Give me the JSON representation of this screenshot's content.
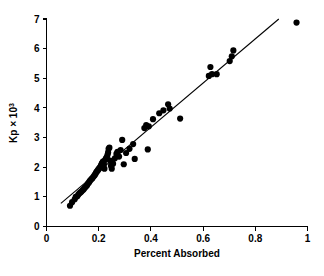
{
  "chart_data": {
    "type": "scatter",
    "title": "",
    "xlabel": "Percent Absorbed",
    "ylabel": "Kp × 10",
    "ylabel_exponent": "3",
    "xlim": [
      0,
      1
    ],
    "ylim": [
      0,
      7
    ],
    "xticks": [
      0,
      0.2,
      0.4,
      0.6,
      0.8,
      1
    ],
    "xtick_labels": [
      "0",
      "0.2",
      "0.4",
      "0.6",
      "0.8",
      "1"
    ],
    "yticks": [
      0,
      1,
      2,
      3,
      4,
      5,
      6,
      7
    ],
    "ytick_labels": [
      "0",
      "1",
      "2",
      "3",
      "4",
      "5",
      "6",
      "7"
    ],
    "grid": false,
    "legend": false,
    "point_color": "#000000",
    "line_color": "#000000",
    "background_color": "#ffffff",
    "marker": "filled-circle",
    "marker_size_px": 3.1,
    "fit_line": {
      "x_start": 0.055,
      "y_start": 0.78,
      "x_end": 0.89,
      "y_end": 7.0,
      "slope": 7.44,
      "intercept": 0.37
    },
    "points": [
      [
        0.09,
        0.7
      ],
      [
        0.098,
        0.82
      ],
      [
        0.108,
        0.92
      ],
      [
        0.112,
        1.0
      ],
      [
        0.118,
        1.02
      ],
      [
        0.122,
        1.08
      ],
      [
        0.126,
        1.12
      ],
      [
        0.13,
        1.15
      ],
      [
        0.134,
        1.18
      ],
      [
        0.138,
        1.22
      ],
      [
        0.142,
        1.25
      ],
      [
        0.146,
        1.3
      ],
      [
        0.15,
        1.34
      ],
      [
        0.155,
        1.38
      ],
      [
        0.158,
        1.44
      ],
      [
        0.162,
        1.48
      ],
      [
        0.165,
        1.52
      ],
      [
        0.168,
        1.56
      ],
      [
        0.172,
        1.6
      ],
      [
        0.175,
        1.62
      ],
      [
        0.178,
        1.66
      ],
      [
        0.182,
        1.7
      ],
      [
        0.185,
        1.74
      ],
      [
        0.188,
        1.78
      ],
      [
        0.19,
        1.82
      ],
      [
        0.193,
        1.86
      ],
      [
        0.196,
        1.88
      ],
      [
        0.198,
        1.92
      ],
      [
        0.201,
        1.95
      ],
      [
        0.204,
        1.98
      ],
      [
        0.206,
        2.0
      ],
      [
        0.208,
        2.04
      ],
      [
        0.21,
        2.08
      ],
      [
        0.212,
        2.12
      ],
      [
        0.214,
        2.15
      ],
      [
        0.216,
        2.18
      ],
      [
        0.218,
        2.2
      ],
      [
        0.22,
        2.1
      ],
      [
        0.222,
        1.95
      ],
      [
        0.225,
        2.25
      ],
      [
        0.228,
        2.3
      ],
      [
        0.231,
        2.34
      ],
      [
        0.234,
        2.42
      ],
      [
        0.236,
        2.5
      ],
      [
        0.238,
        2.62
      ],
      [
        0.241,
        2.66
      ],
      [
        0.244,
        2.22
      ],
      [
        0.247,
        2.05
      ],
      [
        0.25,
        1.95
      ],
      [
        0.255,
        2.12
      ],
      [
        0.262,
        2.3
      ],
      [
        0.268,
        2.45
      ],
      [
        0.272,
        2.52
      ],
      [
        0.278,
        2.36
      ],
      [
        0.284,
        2.58
      ],
      [
        0.29,
        2.92
      ],
      [
        0.296,
        2.1
      ],
      [
        0.305,
        2.48
      ],
      [
        0.318,
        2.62
      ],
      [
        0.332,
        2.78
      ],
      [
        0.338,
        2.28
      ],
      [
        0.375,
        3.32
      ],
      [
        0.382,
        3.42
      ],
      [
        0.388,
        2.6
      ],
      [
        0.392,
        3.38
      ],
      [
        0.408,
        3.62
      ],
      [
        0.432,
        3.82
      ],
      [
        0.448,
        3.92
      ],
      [
        0.466,
        4.12
      ],
      [
        0.472,
        3.98
      ],
      [
        0.512,
        3.64
      ],
      [
        0.622,
        5.08
      ],
      [
        0.628,
        5.38
      ],
      [
        0.634,
        5.14
      ],
      [
        0.652,
        5.14
      ],
      [
        0.702,
        5.58
      ],
      [
        0.71,
        5.74
      ],
      [
        0.716,
        5.94
      ],
      [
        0.958,
        6.88
      ]
    ]
  }
}
